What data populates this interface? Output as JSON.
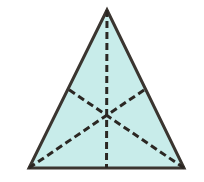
{
  "figure": {
    "name": "triangle-with-medians",
    "canvas": {
      "width": 204,
      "height": 182,
      "background": "#ffffff"
    },
    "shape_type": "triangle",
    "colors": {
      "fill": "#c8ecea",
      "outline": "#3a3530",
      "median_dash": "#2b2723",
      "background": "#ffffff"
    },
    "outline": {
      "stroke_width": 3,
      "style": "solid"
    },
    "medians": {
      "stroke_width": 3,
      "style": "dashed",
      "dash_pattern": "7,4",
      "count": 3
    },
    "vertices": [
      {
        "label": "apex",
        "x": 107,
        "y": 10
      },
      {
        "label": "bottom-left",
        "x": 29,
        "y": 168
      },
      {
        "label": "bottom-right",
        "x": 184,
        "y": 168
      }
    ],
    "midpoints": [
      {
        "label": "base-midpoint",
        "x": 106.5,
        "y": 168
      },
      {
        "label": "left-side-midpoint",
        "x": 68,
        "y": 89
      },
      {
        "label": "right-side-midpoint",
        "x": 145.5,
        "y": 89
      }
    ],
    "centroid": {
      "label": "centroid",
      "x": 106.7,
      "y": 115.3
    },
    "polygon_points": "107,10 184,168 29,168",
    "median_segments": [
      {
        "name": "median-apex-to-base",
        "x1": 107,
        "y1": 10,
        "x2": 106.5,
        "y2": 168
      },
      {
        "name": "median-bottomleft-to-right-side",
        "x1": 29,
        "y1": 168,
        "x2": 145.5,
        "y2": 89
      },
      {
        "name": "median-bottomright-to-left-side",
        "x1": 184,
        "y1": 168,
        "x2": 68,
        "y2": 89
      }
    ]
  }
}
